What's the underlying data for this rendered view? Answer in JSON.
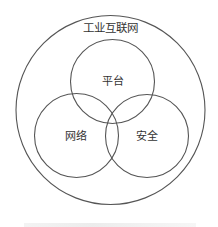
{
  "diagram": {
    "type": "venn",
    "outer_set": {
      "label": "工业互联网"
    },
    "sets": [
      {
        "id": "platform",
        "label": "平台"
      },
      {
        "id": "network",
        "label": "网络"
      },
      {
        "id": "security",
        "label": "安全"
      }
    ],
    "colors": {
      "stroke": "#555555",
      "text": "#333333",
      "background": "#ffffff"
    }
  }
}
